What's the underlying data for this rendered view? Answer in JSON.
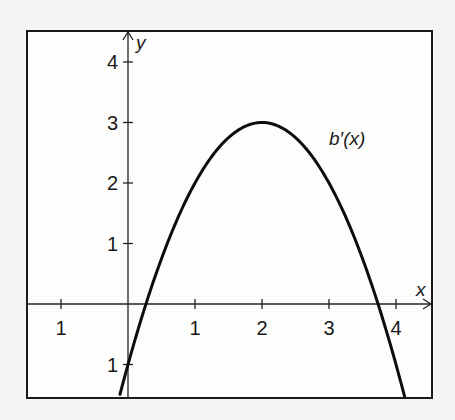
{
  "chart_data": {
    "type": "line",
    "title": "",
    "xlabel": "x",
    "ylabel": "y",
    "xlim": [
      -1.5,
      4.5
    ],
    "ylim": [
      -1.55,
      4.5
    ],
    "grid": false,
    "x_ticks": [
      -1,
      1,
      2,
      3,
      4
    ],
    "x_tick_labels": [
      "1",
      "1",
      "2",
      "3",
      "4"
    ],
    "y_ticks": [
      4,
      3,
      2,
      1,
      -1
    ],
    "y_tick_labels": [
      "4",
      "3",
      "2",
      "1",
      "1"
    ],
    "series": [
      {
        "name": "b'(x)",
        "label": "b′(x)",
        "formula": "y = 3 - (x - 2)^2",
        "x_range": [
          -0.12,
          4.13
        ],
        "points": [
          {
            "x": -0.12,
            "y": -1.49
          },
          {
            "x": 0,
            "y": -1
          },
          {
            "x": 0.27,
            "y": 0
          },
          {
            "x": 0.5,
            "y": 0.75
          },
          {
            "x": 1,
            "y": 2
          },
          {
            "x": 1.5,
            "y": 2.75
          },
          {
            "x": 2,
            "y": 3
          },
          {
            "x": 2.5,
            "y": 2.75
          },
          {
            "x": 3,
            "y": 2
          },
          {
            "x": 3.5,
            "y": 0.75
          },
          {
            "x": 3.73,
            "y": 0
          },
          {
            "x": 4,
            "y": -1
          },
          {
            "x": 4.13,
            "y": -1.54
          }
        ],
        "vertex": {
          "x": 2,
          "y": 3
        },
        "roots": [
          0.27,
          3.73
        ],
        "label_position": "right of peak",
        "color": "#0d0d0d"
      }
    ]
  }
}
